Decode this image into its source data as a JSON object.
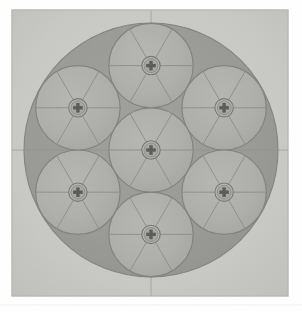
{
  "figure": {
    "title": "Hexagonal close packing of seven circles",
    "kind": "technical-illustration",
    "medium": "halftone scan",
    "page_background": "#ffffff",
    "panel": {
      "name": "scanned-photo-panel",
      "x": 12,
      "y": 10,
      "width": 276,
      "height": 286,
      "fill": "#c9c9c6",
      "edge_shadow": "#b4b4b0"
    },
    "outer_circle": {
      "name": "large-dark-circle",
      "cx": 151,
      "cy": 150,
      "r": 127,
      "fill": "#8e8e8b",
      "stroke": "#6f6f6c",
      "stroke_width": 1.1
    },
    "small_circle": {
      "r": 42.2,
      "fill": "#a8a8a4",
      "stroke": "#6e6e6b",
      "stroke_width": 1.2,
      "count": 7,
      "arrangement": "hexagonal: 1 center + 6 ring",
      "ring_radius": 84.4,
      "ring_start_angle_deg": 90,
      "ring_step_deg": 60
    },
    "spokes": {
      "name": "radial-spoke-lines",
      "per_circle": 6,
      "angles_deg": [
        0,
        60,
        120,
        180,
        240,
        300
      ],
      "stroke": "#7a7a77",
      "stroke_width": 0.9
    },
    "screw_head": {
      "name": "phillips-screw-head",
      "outer_r": 9.2,
      "outer_fill": "#b6b6b2",
      "outer_stroke": "#5f5f5c",
      "inner_r": 7.0,
      "inner_fill": "#9d9d99",
      "cross_fill": "#3e3e3c",
      "cross_arm_length": 9.6,
      "cross_arm_width": 3.4
    },
    "registration_lines": {
      "name": "registration-crosshair",
      "stroke": "#7e7e7b",
      "stroke_width": 0.8,
      "horizontal_y": 150,
      "vertical_x": 151
    },
    "circle_centers": [
      {
        "label": "center",
        "cx": 151.0,
        "cy": 150.0
      },
      {
        "label": "top",
        "cx": 151.0,
        "cy": 65.6
      },
      {
        "label": "upper-right",
        "cx": 224.1,
        "cy": 107.8
      },
      {
        "label": "lower-right",
        "cx": 224.1,
        "cy": 192.2
      },
      {
        "label": "bottom",
        "cx": 151.0,
        "cy": 234.4
      },
      {
        "label": "lower-left",
        "cx": 77.9,
        "cy": 192.2
      },
      {
        "label": "upper-left",
        "cx": 77.9,
        "cy": 107.8
      }
    ],
    "palette": {
      "page": "#ffffff",
      "panel": "#c9c9c6",
      "dark_gray": "#8e8e8b",
      "light_gray": "#a8a8a4",
      "line_gray": "#6e6e6b",
      "screw_dark": "#3e3e3c"
    }
  }
}
